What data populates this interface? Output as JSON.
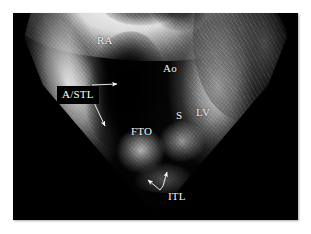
{
  "figure": {
    "modality": "echocardiogram",
    "view": "four-chamber ultrasound sector scan",
    "background_color": "#ffffff",
    "plate_color": "#000000",
    "annotation_color": "#f2f2f2"
  },
  "annotations": {
    "ra": {
      "label": "RA",
      "meaning": "right atrium",
      "x": 97,
      "y": 35
    },
    "ao": {
      "label": "Ao",
      "meaning": "aorta",
      "x": 163,
      "y": 63
    },
    "astl": {
      "label": "A/STL",
      "meaning": "anterior / septal tricuspid leaflet",
      "x": 44,
      "y": 73,
      "boxed": true,
      "box_color": "#000000"
    },
    "s": {
      "label": "S",
      "meaning": "septum",
      "x": 176,
      "y": 110
    },
    "lv": {
      "label": "LV",
      "meaning": "left ventricle",
      "x": 196,
      "y": 107
    },
    "fto": {
      "label": "FTO",
      "meaning": "functional tricuspid orifice",
      "x": 131,
      "y": 126
    },
    "itl": {
      "label": "ITL",
      "meaning": "inferior tricuspid leaflet",
      "x": 168,
      "y": 191
    }
  },
  "pointers": [
    {
      "name": "astl-upper-arrow",
      "from_x": 92,
      "from_y": 85,
      "to_x": 117,
      "to_y": 84
    },
    {
      "name": "astl-lower-arrow",
      "from_x": 89,
      "from_y": 92,
      "to_x": 105,
      "to_y": 126
    },
    {
      "name": "itl-left-arrow",
      "from_x": 160,
      "from_y": 190,
      "to_x": 148,
      "to_y": 180
    },
    {
      "name": "itl-right-arrow",
      "from_x": 163,
      "from_y": 186,
      "to_x": 167,
      "to_y": 172
    }
  ]
}
